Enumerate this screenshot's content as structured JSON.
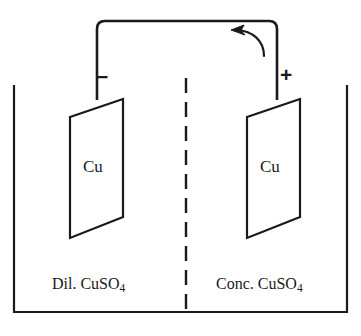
{
  "figure": {
    "stroke_color": "#1a1a1a",
    "background_color": "#ffffff"
  },
  "cell": {
    "container": {
      "name": "electrolytic-cell-container"
    },
    "divider": {
      "name": "porous-partition",
      "style": "dashed"
    },
    "half_cells": [
      {
        "side": "left",
        "terminal_sign": "−",
        "electrode_label": "Cu",
        "solution_label_prefix": "Dil. CuSO",
        "solution_label_subscript": "4",
        "solution_label_full": "Dil. CuSO4"
      },
      {
        "side": "right",
        "terminal_sign": "+",
        "electrode_label": "Cu",
        "solution_label_prefix": "Conc. CuSO",
        "solution_label_subscript": "4",
        "solution_label_full": "Conc. CuSO4"
      }
    ]
  },
  "circuit": {
    "wire_name": "connecting-wire",
    "current_arrow": {
      "name": "current-direction-arrow",
      "direction": "left"
    }
  }
}
